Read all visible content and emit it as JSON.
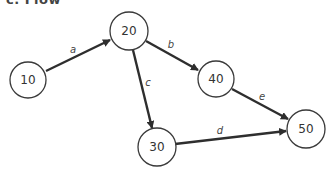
{
  "title_fragment": "c. Flow",
  "diagram": {
    "type": "directed-graph",
    "nodes": [
      {
        "id": "n10",
        "label": "10",
        "cx": 28,
        "cy": 80
      },
      {
        "id": "n20",
        "label": "20",
        "cx": 129,
        "cy": 31
      },
      {
        "id": "n40",
        "label": "40",
        "cx": 216,
        "cy": 79
      },
      {
        "id": "n30",
        "label": "30",
        "cx": 157,
        "cy": 147
      },
      {
        "id": "n50",
        "label": "50",
        "cx": 306,
        "cy": 129
      }
    ],
    "edges": [
      {
        "id": "a",
        "label": "a",
        "from": "10",
        "to": "20"
      },
      {
        "id": "b",
        "label": "b",
        "from": "20",
        "to": "40"
      },
      {
        "id": "c",
        "label": "c",
        "from": "20",
        "to": "30"
      },
      {
        "id": "d",
        "label": "d",
        "from": "30",
        "to": "50"
      },
      {
        "id": "e",
        "label": "e",
        "from": "40",
        "to": "50"
      }
    ],
    "colors": {
      "stroke": "#2e2e2e",
      "node_fill": "#ffffff",
      "text": "#333333"
    }
  }
}
